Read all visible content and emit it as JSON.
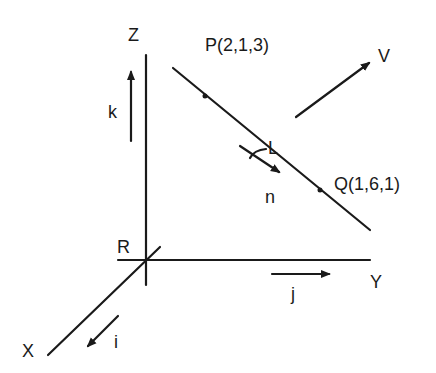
{
  "diagram": {
    "type": "3d-vector-geometry",
    "axes": {
      "z": {
        "label": "Z",
        "unit_vector": "k"
      },
      "y": {
        "label": "Y",
        "unit_vector": "j"
      },
      "x": {
        "label": "X",
        "unit_vector": "i"
      }
    },
    "origin": {
      "label": "R"
    },
    "line": {
      "label": "L",
      "direction_label": "n"
    },
    "points": [
      {
        "label": "P(2,1,3)",
        "name": "P",
        "coords": [
          2,
          1,
          3
        ]
      },
      {
        "label": "Q(1,6,1)",
        "name": "Q",
        "coords": [
          1,
          6,
          1
        ]
      }
    ],
    "vector": {
      "label": "V"
    },
    "colors": {
      "ink": "#1a1a1a",
      "background": "#ffffff"
    }
  }
}
